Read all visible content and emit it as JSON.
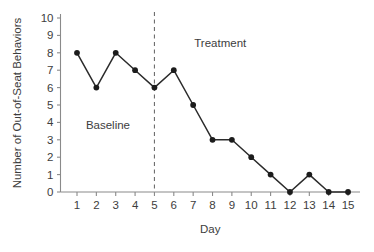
{
  "chart_data": {
    "type": "line",
    "title": "",
    "xlabel": "Day",
    "ylabel": "Number of Out-of-Seat Behaviors",
    "x": [
      1,
      2,
      3,
      4,
      5,
      6,
      7,
      8,
      9,
      10,
      11,
      12,
      13,
      14,
      15
    ],
    "values": [
      8,
      6,
      8,
      7,
      6,
      7,
      5,
      3,
      3,
      2,
      1,
      0,
      1,
      0,
      0
    ],
    "series": [
      {
        "name": "Out-of-Seat Behaviors",
        "values": [
          8,
          6,
          8,
          7,
          6,
          7,
          5,
          3,
          3,
          2,
          1,
          0,
          1,
          0,
          0
        ]
      }
    ],
    "xlim": [
      0.5,
      15.5
    ],
    "ylim": [
      0,
      10
    ],
    "xticks": [
      "1",
      "2",
      "3",
      "4",
      "5",
      "6",
      "7",
      "8",
      "9",
      "10",
      "11",
      "12",
      "13",
      "14",
      "15"
    ],
    "yticks": [
      "0",
      "1",
      "2",
      "3",
      "4",
      "5",
      "6",
      "7",
      "8",
      "9",
      "10"
    ],
    "grid": false,
    "legend": "none",
    "marker": "filled-circle",
    "line_color": "#2b2b2b",
    "axis_color": "#8a8a8a",
    "annotations": [
      {
        "name": "baseline-phase-label",
        "text": "Baseline",
        "x": 2.6,
        "y": 3.6
      },
      {
        "name": "treatment-phase-label",
        "text": "Treatment",
        "x": 8.4,
        "y": 8.35
      }
    ],
    "phase_divider": {
      "name": "phase-change-line",
      "x": 5,
      "style": "dashed",
      "color": "#6e6e6e"
    }
  },
  "axes": {
    "x_axis_title": "Day",
    "y_axis_title": "Number of Out-of-Seat Behaviors"
  }
}
